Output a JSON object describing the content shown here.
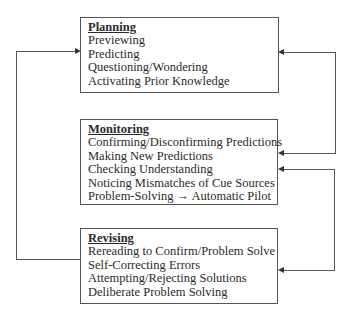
{
  "diagram": {
    "boxes": [
      {
        "id": "planning",
        "title": "Planning",
        "items": [
          "Previewing",
          "Predicting",
          "Questioning/Wondering",
          "Activating Prior Knowledge"
        ]
      },
      {
        "id": "monitoring",
        "title": "Monitoring",
        "items": [
          "Confirming/Disconfirming Predictions",
          "Making New Predictions",
          "Checking Understanding",
          "Noticing Mismatches of Cue Sources",
          "Problem-Solving → Automatic Pilot"
        ]
      },
      {
        "id": "revising",
        "title": "Revising",
        "items": [
          "Rereading to Confirm/Problem Solve",
          "Self-Correcting Errors",
          "Attempting/Rejecting Solutions",
          "Deliberate Problem Solving"
        ]
      }
    ],
    "connectors": [
      {
        "from": "revising",
        "to": "planning",
        "side": "left"
      },
      {
        "from": "monitoring",
        "to": "planning",
        "side": "right"
      },
      {
        "from": "revising",
        "to": "monitoring",
        "side": "right"
      }
    ],
    "colors": {
      "line": "#555555",
      "text": "#2a2a2a",
      "background": "#ffffff"
    }
  }
}
